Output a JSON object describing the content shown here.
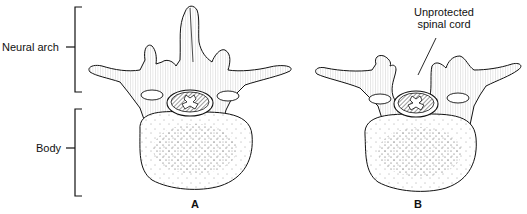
{
  "labels": {
    "neural_arch": "Neural arch",
    "body": "Body",
    "unprotected_line1": "Unprotected",
    "unprotected_line2": "spinal cord"
  },
  "captions": {
    "a": "A",
    "b": "B"
  },
  "figures": [
    {
      "id": "A",
      "description": "Normal vertebra with intact neural arch and spinous process"
    },
    {
      "id": "B",
      "description": "Vertebra lacking spinous process (spina bifida) leaving spinal cord unprotected"
    }
  ]
}
